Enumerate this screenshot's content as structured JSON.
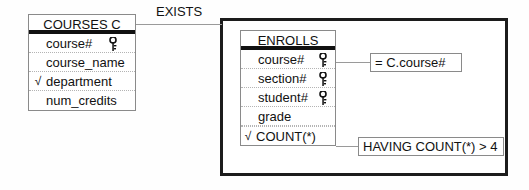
{
  "diagram": {
    "relationship_label": "EXISTS",
    "colors": {
      "frame": "#1c1c1c",
      "table_border": "#8a8a8a",
      "row_divider": "#b4b4b4",
      "connector": "#9a9a9a",
      "text": "#111111",
      "background": "#fefefe"
    }
  },
  "courses_table": {
    "title": "COURSES  C",
    "rows": [
      {
        "mark": "",
        "name": "course#",
        "key": "key-icon"
      },
      {
        "mark": "",
        "name": "course_name",
        "key": ""
      },
      {
        "mark": "√",
        "name": "department",
        "key": ""
      },
      {
        "mark": "",
        "name": "num_credits",
        "key": ""
      }
    ]
  },
  "enrolls_table": {
    "title": "ENROLLS",
    "rows": [
      {
        "mark": "",
        "name": "course#",
        "key": "key-icon"
      },
      {
        "mark": "",
        "name": "section#",
        "key": "key-icon"
      },
      {
        "mark": "",
        "name": "student#",
        "key": "key-icon"
      },
      {
        "mark": "",
        "name": "grade",
        "key": ""
      },
      {
        "mark": "√",
        "name": "COUNT(*)",
        "key": ""
      }
    ]
  },
  "conditions": {
    "join_condition": "= C.course#",
    "having_condition": "HAVING COUNT(*)  > 4"
  }
}
